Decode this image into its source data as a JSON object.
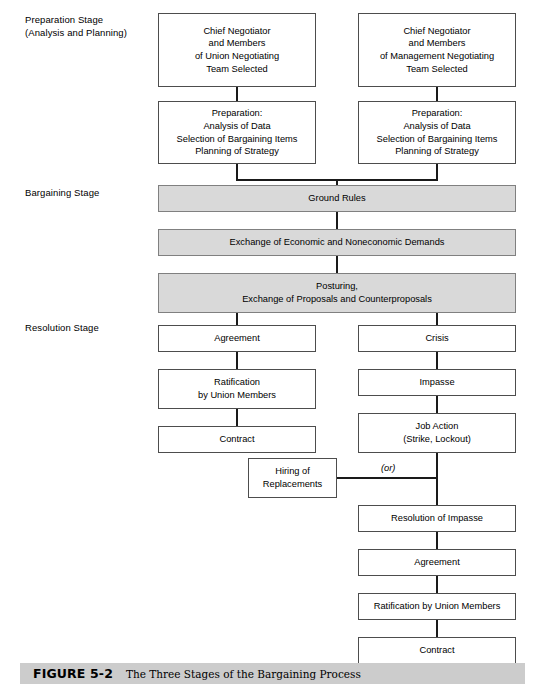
{
  "figure": {
    "number": "FIGURE 5-2",
    "title": "The Three Stages of the Bargaining Process"
  },
  "stages": [
    {
      "id": "preparation",
      "label": "Preparation Stage\n(Analysis and Planning)"
    },
    {
      "id": "bargaining",
      "label": "Bargaining Stage"
    },
    {
      "id": "resolution",
      "label": "Resolution Stage"
    }
  ],
  "connector_labels": {
    "or": "(or)"
  },
  "colors": {
    "shaded_fill": "#d9d9d9",
    "box_border": "#4d4d4d",
    "shaded_border": "#808080",
    "line": "#1a1a1a",
    "caption_bar": "#cccccc"
  },
  "nodes": {
    "union_team": "Chief Negotiator\nand Members\nof Union Negotiating\nTeam Selected",
    "management_team": "Chief Negotiator\nand Members\nof Management Negotiating\nTeam Selected",
    "union_preparation": "Preparation:\nAnalysis of Data\nSelection of Bargaining Items\nPlanning of Strategy",
    "management_preparation": "Preparation:\nAnalysis of Data\nSelection of Bargaining Items\nPlanning of Strategy",
    "ground_rules": "Ground Rules",
    "exchange_demands": "Exchange of Economic and Noneconomic Demands",
    "posturing": "Posturing,\nExchange of Proposals and Counterproposals",
    "agreement_left": "Agreement",
    "ratification_left": "Ratification\nby Union Members",
    "contract_left": "Contract",
    "crisis": "Crisis",
    "impasse": "Impasse",
    "job_action": "Job Action\n(Strike, Lockout)",
    "hiring_replacements": "Hiring of\nReplacements",
    "resolution_of_impasse": "Resolution of Impasse",
    "agreement_right": "Agreement",
    "ratification_right": "Ratification by Union Members",
    "contract_right": "Contract"
  }
}
